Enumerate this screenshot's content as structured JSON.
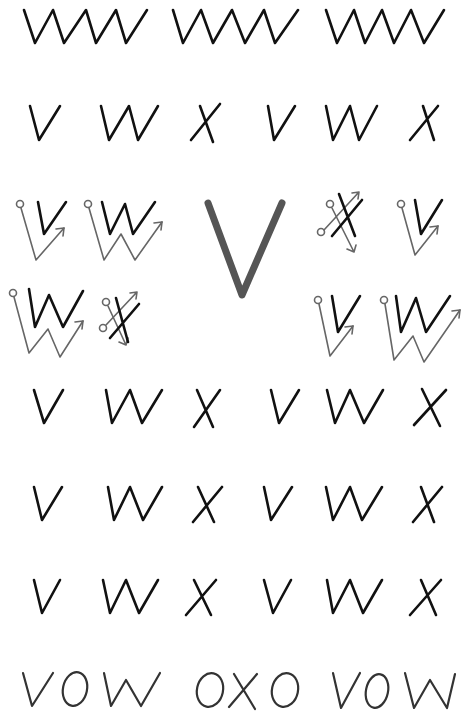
{
  "worksheet": {
    "subject": "Handwriting practice: letters V, W, X",
    "feature_letter": "V",
    "colors": {
      "ink": "#111111",
      "guide": "#666666",
      "feature": "#555555"
    },
    "zigzag_row": {
      "count": 3,
      "pattern": "zigzag"
    },
    "letter_rows": [
      [
        "V",
        "W",
        "X",
        "V",
        "W",
        "X"
      ],
      [
        "V",
        "W",
        "X",
        "V",
        "W",
        "X"
      ],
      [
        "V",
        "W",
        "X",
        "V",
        "W",
        "X"
      ],
      [
        "V",
        "W",
        "X",
        "V",
        "W",
        "X"
      ]
    ],
    "stroke_guides": [
      {
        "letter": "V",
        "position": "top-left"
      },
      {
        "letter": "W",
        "position": "top-left-2"
      },
      {
        "letter": "X",
        "position": "top-right-1"
      },
      {
        "letter": "V",
        "position": "top-right-2"
      },
      {
        "letter": "W",
        "position": "bottom-left-1"
      },
      {
        "letter": "X",
        "position": "bottom-left-2"
      },
      {
        "letter": "V",
        "position": "bottom-right-1"
      },
      {
        "letter": "W",
        "position": "bottom-right-2"
      }
    ],
    "words": [
      "VOW",
      "OXO",
      "VOW"
    ]
  }
}
